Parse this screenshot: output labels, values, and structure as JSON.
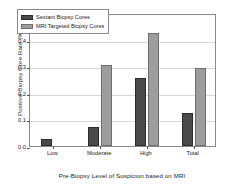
{
  "chart_data": {
    "type": "bar",
    "title": "",
    "xlabel": "Pre-Biopsy Level of Suspicion based on MRI",
    "ylabel": "Positive Biopsy Core Rate (%)",
    "categories": [
      "Low",
      "Moderate",
      "High",
      "Total"
    ],
    "series": [
      {
        "name": "Sextant Biopsy Cores",
        "color": "#4a4a4a",
        "values": [
          0.028,
          0.072,
          0.257,
          0.125
        ]
      },
      {
        "name": "MRI Targeted Biopsy Cores",
        "color": "#9d9d9d",
        "values": [
          0.0,
          0.305,
          0.425,
          0.293
        ]
      }
    ],
    "ylim": [
      0.0,
      0.5
    ],
    "yticks": [
      "0.0",
      "0.1",
      "0.2",
      "0.3",
      "0.4",
      "0.5"
    ],
    "ytick_values": [
      0.0,
      0.1,
      0.2,
      0.3,
      0.4,
      0.5
    ],
    "grid": true,
    "legend_position": "upper left"
  },
  "legend": {
    "entries": [
      {
        "label": "Sextant Biopsy Cores"
      },
      {
        "label": "MRI Targeted Biopsy Cores"
      }
    ]
  }
}
